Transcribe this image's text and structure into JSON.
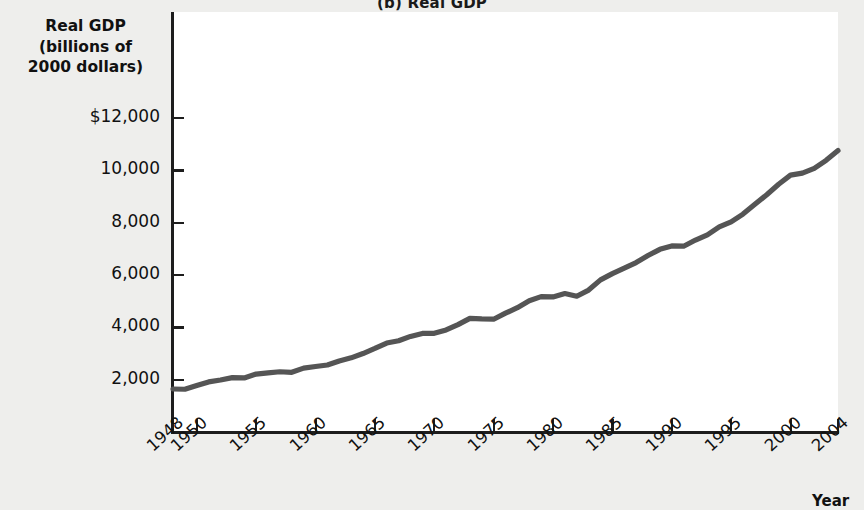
{
  "figure": {
    "panel_label": "(b)",
    "title": "(b)  Real GDP",
    "background_color": "#eeeeec",
    "plot_background_color": "#ffffff",
    "axis_color": "#1d1d1d",
    "line_color": "#555555"
  },
  "axes": {
    "y_title_lines": [
      "Real GDP",
      "(billions of",
      "2000 dollars)"
    ],
    "x_title": "Year"
  },
  "chart_data": {
    "type": "line",
    "title": "(b)  Real GDP",
    "xlabel": "Year",
    "ylabel": "Real GDP (billions of 2000 dollars)",
    "xlim": [
      1948,
      2004
    ],
    "ylim": [
      0,
      13000
    ],
    "grid": false,
    "legend": "none",
    "y_ticks": [
      2000,
      4000,
      6000,
      8000,
      10000,
      12000
    ],
    "y_tick_labels": [
      "2,000",
      "4,000",
      "6,000",
      "8,000",
      "10,000",
      "$12,000"
    ],
    "x_ticks": [
      1948,
      1950,
      1955,
      1960,
      1965,
      1970,
      1975,
      1980,
      1985,
      1990,
      1995,
      2000,
      2004
    ],
    "x_tick_labels": [
      "1948",
      "1950",
      "1955",
      "1960",
      "1965",
      "1970",
      "1975",
      "1980",
      "1985",
      "1990",
      "1995",
      "2000",
      "2004"
    ],
    "series": [
      {
        "name": "Real GDP",
        "color": "#555555",
        "x": [
          1948,
          1949,
          1950,
          1951,
          1952,
          1953,
          1954,
          1955,
          1956,
          1957,
          1958,
          1959,
          1960,
          1961,
          1962,
          1963,
          1964,
          1965,
          1966,
          1967,
          1968,
          1969,
          1970,
          1971,
          1972,
          1973,
          1974,
          1975,
          1976,
          1977,
          1978,
          1979,
          1980,
          1981,
          1982,
          1983,
          1984,
          1985,
          1986,
          1987,
          1988,
          1989,
          1990,
          1991,
          1992,
          1993,
          1994,
          1995,
          1996,
          1997,
          1998,
          1999,
          2000,
          2001,
          2002,
          2003,
          2004
        ],
        "values": [
          1644,
          1634,
          1777,
          1915,
          1988,
          2079,
          2065,
          2213,
          2257,
          2302,
          2282,
          2441,
          2502,
          2560,
          2715,
          2834,
          2999,
          3192,
          3399,
          3485,
          3653,
          3766,
          3772,
          3899,
          4105,
          4342,
          4320,
          4311,
          4541,
          4751,
          5015,
          5173,
          5162,
          5292,
          5189,
          5424,
          5814,
          6054,
          6264,
          6475,
          6743,
          6981,
          7113,
          7101,
          7337,
          7533,
          7836,
          8032,
          8329,
          8704,
          9067,
          9470,
          9817,
          9891,
          10075,
          10381,
          10754
        ],
        "units": "billions of 2000 dollars",
        "first_value": 1644,
        "last_value": 10754
      }
    ],
    "annotations": [
      "Recession-related flat segments visible around 1949, 1954, 1958, 1974-1975, 1980-1982, 1991 and 2001"
    ]
  }
}
